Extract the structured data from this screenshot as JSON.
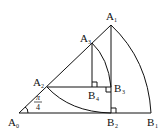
{
  "diagram": {
    "stroke_color": "#111111",
    "background": "#ffffff",
    "angle_label": {
      "numerator": "π",
      "denominator": "4"
    },
    "points": {
      "A0": {
        "base": "A",
        "sub": "0"
      },
      "A1": {
        "base": "A",
        "sub": "1"
      },
      "A2": {
        "base": "A",
        "sub": "2"
      },
      "A3": {
        "base": "A",
        "sub": "3"
      },
      "B1": {
        "base": "B",
        "sub": "1"
      },
      "B2": {
        "base": "B",
        "sub": "2"
      },
      "B3": {
        "base": "B",
        "sub": "3"
      },
      "B4": {
        "base": "B",
        "sub": "4"
      }
    }
  }
}
